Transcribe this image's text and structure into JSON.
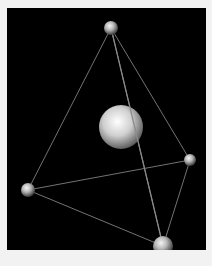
{
  "scene": {
    "background": "#000000",
    "frame_color": "#f2f2f2",
    "description": "Tetrahedron with spheres at vertices and a large sphere at center",
    "vertices": [
      {
        "name": "top",
        "cx": 104,
        "cy": 20,
        "r": 7
      },
      {
        "name": "right",
        "cx": 183,
        "cy": 152,
        "r": 6
      },
      {
        "name": "left",
        "cx": 21,
        "cy": 182,
        "r": 7
      },
      {
        "name": "bottom",
        "cx": 156,
        "cy": 238,
        "r": 10
      }
    ],
    "center_sphere": {
      "cx": 114,
      "cy": 119,
      "r": 22
    },
    "edges": [
      [
        "top",
        "left"
      ],
      [
        "top",
        "right"
      ],
      [
        "top",
        "bottom"
      ],
      [
        "left",
        "right"
      ],
      [
        "left",
        "bottom"
      ],
      [
        "right",
        "bottom"
      ]
    ]
  }
}
